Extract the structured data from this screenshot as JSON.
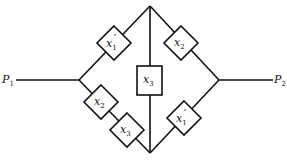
{
  "diagram": {
    "title": "",
    "terminals": [
      {
        "id": "P1",
        "label": "P",
        "sub": "1"
      },
      {
        "id": "P2",
        "label": "P",
        "sub": "2"
      }
    ],
    "components": [
      {
        "id": "top-left",
        "shape": "diamond",
        "label": "x",
        "sub": "1",
        "prime": "′"
      },
      {
        "id": "top-right",
        "shape": "diamond",
        "label": "x",
        "sub": "2",
        "prime": ""
      },
      {
        "id": "center",
        "shape": "square",
        "label": "x",
        "sub": "3",
        "prime": ""
      },
      {
        "id": "bottom-left-1",
        "shape": "diamond",
        "label": "x",
        "sub": "2",
        "prime": ""
      },
      {
        "id": "bottom-left-2",
        "shape": "diamond",
        "label": "x",
        "sub": "3",
        "prime": ""
      },
      {
        "id": "bottom-right",
        "shape": "diamond",
        "label": "x",
        "sub": "1",
        "prime": "′"
      }
    ],
    "colors": {
      "stroke": "#111111",
      "background": "#ffffff"
    }
  }
}
